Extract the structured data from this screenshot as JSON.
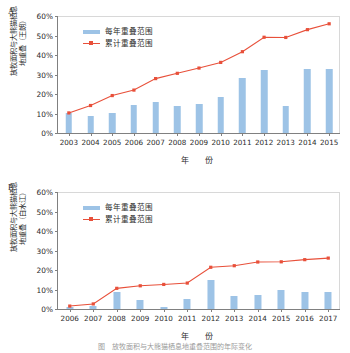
{
  "figure": {
    "caption": "图　放牧面积与大熊猫栖息地重叠范围的年际变化"
  },
  "panels": [
    {
      "letter": "A.",
      "ylabel": "放牧面积与大熊猫栖息\n地重叠（王朗）",
      "xlabel": "年　份",
      "legend": {
        "bar_label": "每年重叠范围",
        "line_label": "累计重叠范围"
      },
      "yticks": [
        "0%",
        "10%",
        "20%",
        "30%",
        "40%",
        "50%",
        "60%"
      ],
      "colors": {
        "bar": "#9dc3e6",
        "line": "#e8503a",
        "axis": "#808080"
      },
      "chart_data": {
        "type": "bar",
        "title": "放牧面积与大熊猫栖息地重叠（王朗）",
        "xlabel": "年 份",
        "ylabel": "放牧面积与大熊猫栖息地重叠（王朗）",
        "ylim": [
          0,
          60
        ],
        "yticks": [
          0,
          10,
          20,
          30,
          40,
          50,
          60
        ],
        "grid": false,
        "legend_position": "top-left",
        "categories": [
          "2003",
          "2004",
          "2005",
          "2006",
          "2007",
          "2008",
          "2009",
          "2010",
          "2011",
          "2012",
          "2013",
          "2014",
          "2015"
        ],
        "series": [
          {
            "name": "每年重叠范围",
            "type": "bar",
            "values": [
              10.3,
              8.5,
              10.3,
              14.2,
              16.0,
              14.1,
              14.9,
              18.7,
              28.2,
              32.2,
              14.1,
              33.0,
              33.0
            ]
          },
          {
            "name": "累计重叠范围",
            "type": "line",
            "values": [
              10.3,
              14.1,
              19.2,
              22.0,
              27.9,
              30.6,
              33.3,
              36.2,
              41.7,
              49.1,
              49.0,
              53.0,
              56.0
            ]
          }
        ]
      }
    },
    {
      "letter": "B.",
      "ylabel": "放牧面积与大熊猫栖息\n地重叠（白水江）",
      "xlabel": "年　份",
      "legend": {
        "bar_label": "每年重叠范围",
        "line_label": "累计重叠范围"
      },
      "yticks": [
        "0%",
        "10%",
        "20%",
        "30%",
        "40%",
        "50%",
        "60%"
      ],
      "colors": {
        "bar": "#9dc3e6",
        "line": "#e8503a",
        "axis": "#808080"
      },
      "chart_data": {
        "type": "bar",
        "title": "放牧面积与大熊猫栖息地重叠（白水江）",
        "xlabel": "年 份",
        "ylabel": "放牧面积与大熊猫栖息地重叠（白水江）",
        "ylim": [
          0,
          60
        ],
        "yticks": [
          0,
          10,
          20,
          30,
          40,
          50,
          60
        ],
        "grid": false,
        "legend_position": "top-left",
        "categories": [
          "2006",
          "2007",
          "2008",
          "2009",
          "2010",
          "2011",
          "2012",
          "2013",
          "2014",
          "2015",
          "2016",
          "2017"
        ],
        "series": [
          {
            "name": "每年重叠范围",
            "type": "bar",
            "values": [
              0.8,
              1.6,
              8.9,
              4.5,
              0.9,
              5.3,
              14.7,
              6.7,
              7.3,
              9.7,
              8.7,
              8.6
            ]
          },
          {
            "name": "累计重叠范围",
            "type": "line",
            "values": [
              1.5,
              2.6,
              10.6,
              11.9,
              12.6,
              13.3,
              21.4,
              22.2,
              24.1,
              24.2,
              25.3,
              26.1
            ]
          }
        ]
      }
    }
  ]
}
